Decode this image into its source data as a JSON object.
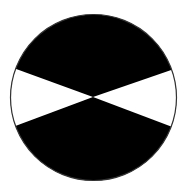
{
  "diagram": {
    "type": "disk-with-opposing-wedges",
    "background": "#ffffff",
    "circle": {
      "cx": 93.5,
      "cy": 97.5,
      "r": 83,
      "fill": "#000000",
      "stroke": "#333333",
      "stroke_width": 1.2
    },
    "center": {
      "x": 93,
      "y": 97
    },
    "wedges": [
      {
        "name": "left-white-wedge",
        "fill": "#ffffff",
        "points": [
          [
            93,
            97
          ],
          [
            14.5,
            68.5
          ],
          [
            11,
            97
          ],
          [
            16.5,
            125.5
          ]
        ]
      },
      {
        "name": "right-white-wedge",
        "fill": "#ffffff",
        "points": [
          [
            93,
            97
          ],
          [
            171.5,
            70
          ],
          [
            176.5,
            97
          ],
          [
            169.5,
            126
          ]
        ]
      }
    ]
  }
}
